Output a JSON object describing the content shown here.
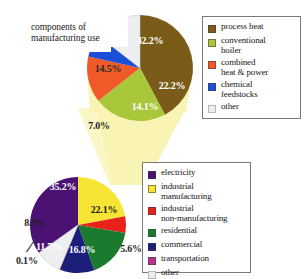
{
  "figure": {
    "annotation": "components of\nmanufacturing use",
    "background": "#ffffff",
    "cone_color": "#f7f2b0"
  },
  "chart_data": [
    {
      "type": "pie",
      "id": "top-pie",
      "title": "components of manufacturing use",
      "labels": [
        "process heat",
        "conventional boiler",
        "combined heat & power",
        "chemical feedstocks",
        "other"
      ],
      "values": [
        42.2,
        22.2,
        14.1,
        7.0,
        14.5
      ],
      "value_labels": [
        "42.2%",
        "22.2%",
        "14.1%",
        "7.0%",
        "14.5%"
      ],
      "colors": [
        "#7a5c18",
        "#a8c73a",
        "#f05a28",
        "#1d4ed8",
        "#edeef0"
      ],
      "label_colors": [
        "#ffffff",
        "#ffffff",
        "#ffffff",
        "#1a1a1a",
        "#2a2a2a"
      ],
      "legend_position": "right",
      "legend_entries": [
        {
          "label": "process heat",
          "color": "#7a5c18"
        },
        {
          "label": "conventional\nboiler",
          "color": "#a8c73a"
        },
        {
          "label": "combined\nheat & power",
          "color": "#f05a28"
        },
        {
          "label": "chemical\nfeedstocks",
          "color": "#1d4ed8"
        },
        {
          "label": "other",
          "color": "#eceded"
        }
      ]
    },
    {
      "type": "pie",
      "id": "bottom-pie",
      "title": "U.S. energy use by sector",
      "labels": [
        "electricity",
        "industrial manufacturing",
        "industrial non-manufacturing",
        "residential",
        "commercial",
        "transportation",
        "other"
      ],
      "values": [
        35.2,
        22.1,
        5.6,
        16.8,
        11.7,
        0.1,
        8.9
      ],
      "value_labels": [
        "35.2%",
        "22.1%",
        "5.6%",
        "16.8%",
        "11.7%",
        "0.1%",
        "8.9%"
      ],
      "colors": [
        "#4b1273",
        "#f7e435",
        "#e8211b",
        "#1a7a2e",
        "#1b1f7a",
        "#b5338c",
        "#edeef0"
      ],
      "label_colors": [
        "#ffffff",
        "#1a1a1a",
        "#1a1a1a",
        "#ffffff",
        "#ffffff",
        "#1a1a1a",
        "#1a1a1a"
      ],
      "legend_position": "right",
      "legend_entries": [
        {
          "label": "electricity",
          "color": "#4b1273"
        },
        {
          "label": "industrial\nmanufacturing",
          "color": "#f7e435"
        },
        {
          "label": "industrial\nnon-manufacturing",
          "color": "#e8211b"
        },
        {
          "label": "residential",
          "color": "#1a7a2e"
        },
        {
          "label": "commercial",
          "color": "#1b1f7a"
        },
        {
          "label": "transportation",
          "color": "#b5338c"
        },
        {
          "label": "other",
          "color": "#eceded"
        }
      ]
    }
  ],
  "top_slice_labels": {
    "process_heat": "42.2%",
    "conventional_boiler": "22.2%",
    "combined_heat_power": "14.1%",
    "chemical_feedstocks": "7.0%",
    "other": "14.5%"
  },
  "bottom_slice_labels": {
    "electricity": "35.2%",
    "industrial_manufacturing": "22.1%",
    "industrial_non_manufacturing": "5.6%",
    "residential": "16.8%",
    "commercial": "11.7%",
    "transportation": "0.1%",
    "other": "8.9%"
  }
}
